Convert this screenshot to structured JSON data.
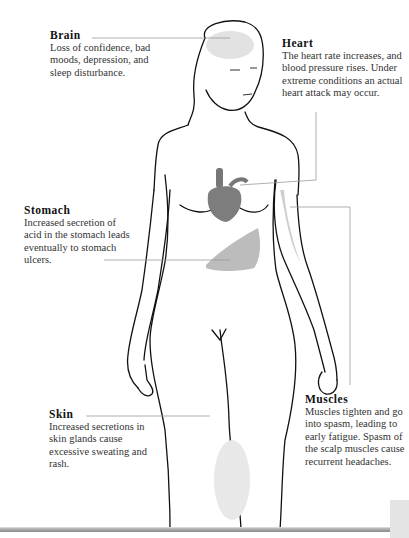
{
  "diagram": {
    "labels": [
      {
        "id": "brain",
        "title": "Brain",
        "text": "Loss of confidence, bad moods, depression, and sleep disturbance."
      },
      {
        "id": "heart",
        "title": "Heart",
        "text": "The heart rate increases, and blood pressure rises. Under extreme conditions an actual heart attack may occur."
      },
      {
        "id": "stomach",
        "title": "Stomach",
        "text": "Increased secretion of acid in the stomach leads eventually to stomach ulcers."
      },
      {
        "id": "skin",
        "title": "Skin",
        "text": "Increased secretions in skin glands cause excessive sweating and rash."
      },
      {
        "id": "muscles",
        "title": "Muscles",
        "text": "Muscles tighten and go into spasm, leading to early fatigue. Spasm of the scalp muscles cause recurrent headaches."
      }
    ],
    "colors": {
      "line": "#111111",
      "leader": "#9a9a9a",
      "organ": "#7a7a7a",
      "floor": "#9a9a9a"
    }
  }
}
